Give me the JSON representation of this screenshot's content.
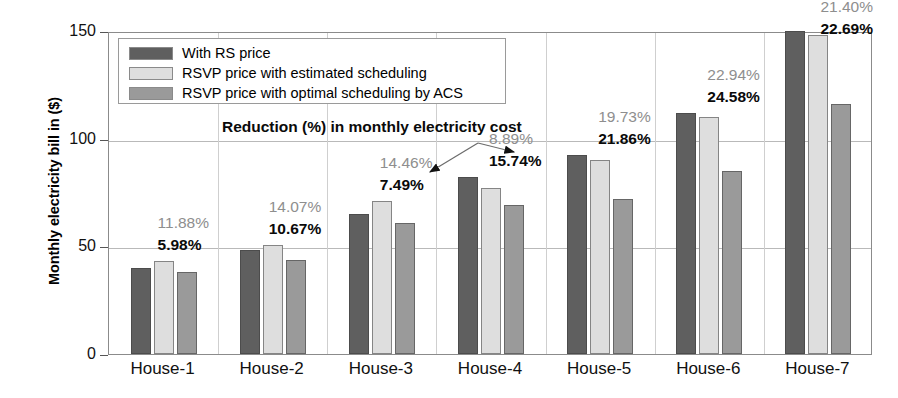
{
  "chart_data": {
    "type": "bar",
    "title": "",
    "xlabel": "",
    "ylabel": "Monthly electricity bill in ($)",
    "ylim": [
      0,
      150
    ],
    "yticks": [
      0,
      50,
      100,
      150
    ],
    "ytick_labels": [
      "0",
      "50",
      "100",
      "150"
    ],
    "grid": true,
    "legend_position": "upper-left-inside",
    "categories": [
      "House-1",
      "House-2",
      "House-3",
      "House-4",
      "House-5",
      "House-6",
      "House-7"
    ],
    "series": [
      {
        "name": "With RS price",
        "color": "#5f5f5f",
        "values": [
          40.0,
          48.5,
          65.0,
          82.0,
          92.5,
          112.0,
          150.0
        ]
      },
      {
        "name": "RSVP price with estimated scheduling",
        "color": "#dedede",
        "values": [
          43.0,
          50.5,
          71.0,
          77.0,
          90.0,
          110.0,
          148.0
        ]
      },
      {
        "name": "RSVP price with optimal scheduling by ACS",
        "color": "#9a9a9a",
        "values": [
          38.0,
          43.5,
          61.0,
          69.0,
          72.0,
          85.0,
          116.0
        ]
      }
    ],
    "annotation_title": "Reduction (%) in monthly electricity cost",
    "annotations": [
      {
        "category": "House-1",
        "estimated_reduction": "11.88%",
        "optimal_reduction": "5.98%"
      },
      {
        "category": "House-2",
        "estimated_reduction": "14.07%",
        "optimal_reduction": "10.67%"
      },
      {
        "category": "House-3",
        "estimated_reduction": "14.46%",
        "optimal_reduction": "7.49%"
      },
      {
        "category": "House-4",
        "estimated_reduction": "8.89%",
        "optimal_reduction": "15.74%"
      },
      {
        "category": "House-5",
        "estimated_reduction": "19.73%",
        "optimal_reduction": "21.86%"
      },
      {
        "category": "House-6",
        "estimated_reduction": "22.94%",
        "optimal_reduction": "24.58%"
      },
      {
        "category": "House-7",
        "estimated_reduction": "21.40%",
        "optimal_reduction": "22.69%"
      }
    ]
  }
}
